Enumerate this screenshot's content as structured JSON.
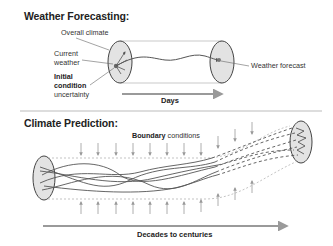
{
  "weather": {
    "title": "Weather Forecasting:",
    "labels": {
      "overall_climate": "Overall climate",
      "current_weather_1": "Current",
      "current_weather_2": "weather",
      "initial_1": "Initial",
      "initial_2": "condition",
      "initial_3": "uncertainty",
      "forecast": "Weather forecast"
    },
    "axis": "Days"
  },
  "climate": {
    "title": "Climate Prediction:",
    "boundary_bold": "Boundary",
    "boundary_rest": " conditions",
    "axis": "Decades  to centuries"
  },
  "colors": {
    "ellipse_fill": "#e3e3e3",
    "line": "#555555",
    "arrow_gray": "#9a9a9a",
    "divider": "#bbbbbb"
  }
}
